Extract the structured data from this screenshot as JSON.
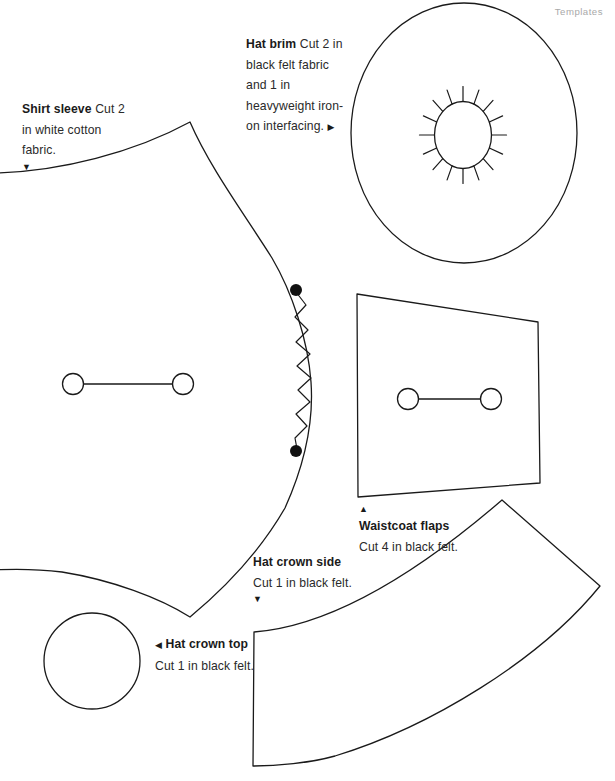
{
  "page": {
    "header": "Templates",
    "background_color": "#ffffff",
    "ink_color": "#1a1a1a",
    "header_color": "#a9a9a9",
    "width": 615,
    "height": 781
  },
  "labels": {
    "shirt_sleeve": {
      "title": "Shirt sleeve",
      "body": "Cut 2 in white cotton fabric.",
      "marker": "▼",
      "marker_name": "triangle-down"
    },
    "hat_brim": {
      "title": "Hat brim",
      "body": "Cut 2 in black felt fabric and 1 in heavyweight iron-on interfacing.",
      "marker": "▶",
      "marker_name": "triangle-right"
    },
    "hat_crown_side": {
      "title": "Hat crown side",
      "body": "Cut 1 in black felt.",
      "marker": "▼",
      "marker_name": "triangle-down"
    },
    "hat_crown_top": {
      "title": "Hat crown top",
      "body": "Cut 1 in black felt.",
      "marker": "◀",
      "marker_name": "triangle-left"
    },
    "waistcoat_flaps": {
      "title": "Waistcoat flaps",
      "body": "Cut 4 in black felt.",
      "marker": "▲",
      "marker_name": "triangle-up"
    }
  },
  "pattern_pieces": [
    {
      "name": "shirt-sleeve",
      "label_ref": "shirt_sleeve",
      "markings": [
        "button-line",
        "zigzag-notch",
        "dot-top",
        "dot-bottom"
      ]
    },
    {
      "name": "hat-brim",
      "label_ref": "hat_brim",
      "markings": [
        "inner-oval",
        "radial-ticks-16"
      ]
    },
    {
      "name": "waistcoat-flaps",
      "label_ref": "waistcoat_flaps",
      "markings": [
        "button-line"
      ]
    },
    {
      "name": "hat-crown-top",
      "label_ref": "hat_crown_top",
      "markings": []
    },
    {
      "name": "hat-crown-side",
      "label_ref": "hat_crown_side",
      "markings": []
    }
  ]
}
